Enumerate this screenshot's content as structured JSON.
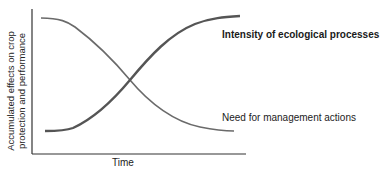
{
  "diagram": {
    "y_axis_label_line1": "Accumulated effects on crop",
    "y_axis_label_line2": "protection and performance",
    "x_axis_label": "Time",
    "curves": [
      {
        "name": "Intensity of ecological processes",
        "trend": "increasing",
        "emphasis": "bold",
        "color": "#555555"
      },
      {
        "name": "Need for management actions",
        "trend": "decreasing",
        "emphasis": "normal",
        "color": "#666666"
      }
    ]
  },
  "labels": {
    "intensity": "Intensity of ecological processes",
    "need": "Need for management actions"
  },
  "colors": {
    "axis": "#333333",
    "curve_increasing": "#555555",
    "curve_decreasing": "#6a6a6a",
    "background": "#ffffff"
  }
}
